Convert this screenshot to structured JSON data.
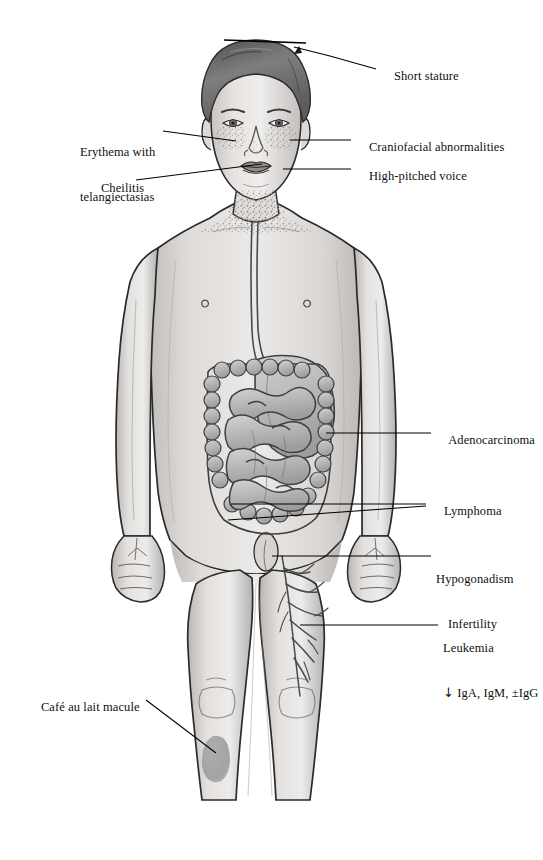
{
  "figure": {
    "background_color": "#ffffff",
    "width": 543,
    "height": 860
  },
  "palette": {
    "ink": "#101010",
    "leader_line": "#000000",
    "skin_light": "#e8e6e4",
    "skin_mid": "#cfcccb",
    "skin_shadow": "#b3b0ae",
    "outline": "#2a2a2a",
    "hair_dark": "#5a5a5a",
    "hair_mid": "#8a8a8a",
    "organ_fill": "#bcbcbc",
    "organ_shadow": "#9a9a9a",
    "organ_outline": "#4a4a4a",
    "macule": "#a3a3a3",
    "speckle": "#9b9b9b"
  },
  "labels": [
    {
      "id": "short-stature",
      "name": "label-short-stature",
      "text": "Short stature",
      "side": "right",
      "x": 381,
      "y": 62,
      "leader": [
        [
          376,
          69
        ],
        [
          330,
          56
        ],
        [
          294,
          47
        ]
      ]
    },
    {
      "id": "craniofacial-abnormalities",
      "name": "label-craniofacial-abnormalities",
      "text": "Craniofacial abnormalities",
      "side": "right",
      "x": 356,
      "y": 133,
      "leader": [
        [
          351,
          140
        ],
        [
          290,
          140
        ]
      ]
    },
    {
      "id": "high-pitched-voice",
      "name": "label-high-pitched-voice",
      "text": "High-pitched voice",
      "side": "right",
      "x": 356,
      "y": 162,
      "leader": [
        [
          351,
          169
        ],
        [
          283,
          169
        ]
      ]
    },
    {
      "id": "erythema-with-telangiectasias",
      "name": "label-erythema-with-telangiectasias",
      "text": "Erythema with",
      "text2": "telangiectasias",
      "side": "left",
      "x": 80,
      "y": 122,
      "leader": [
        [
          163,
          131
        ],
        [
          236,
          141
        ]
      ]
    },
    {
      "id": "cheilitis",
      "name": "label-cheilitis",
      "text": "Cheilitis",
      "side": "left",
      "x": 88,
      "y": 174,
      "leader": [
        [
          136,
          180
        ],
        [
          262,
          164
        ]
      ]
    },
    {
      "id": "adenocarcinoma",
      "name": "label-adenocarcinoma",
      "text": "Adenocarcinoma",
      "side": "right",
      "x": 436,
      "y": 426,
      "leader": [
        [
          431,
          433
        ],
        [
          326,
          433
        ]
      ]
    },
    {
      "id": "lymphoma",
      "name": "label-lymphoma",
      "text": "Lymphoma",
      "side": "right",
      "x": 431,
      "y": 497,
      "leader": [
        [
          426,
          504
        ],
        [
          231,
          504
        ]
      ],
      "leader2": [
        [
          426,
          506
        ],
        [
          228,
          520
        ]
      ]
    },
    {
      "id": "hypogonadism-infertility",
      "name": "label-hypogonadism-infertility",
      "text": "Hypogonadism",
      "text2": "Infertility",
      "side": "right",
      "x": 436,
      "y": 549,
      "leader": [
        [
          431,
          556
        ],
        [
          272,
          556
        ]
      ]
    },
    {
      "id": "leukemia",
      "name": "label-leukemia",
      "text": "Leukemia",
      "text2": "IgA, IgM, ±IgG",
      "sub_arrow": "↓",
      "side": "right",
      "x": 443,
      "y": 618,
      "leader": [
        [
          438,
          625
        ],
        [
          300,
          625
        ]
      ]
    },
    {
      "id": "cafe-au-lait-macule",
      "name": "label-cafe-au-lait-macule",
      "text": "Café au lait macule",
      "side": "left",
      "x": 28,
      "y": 693,
      "leader": [
        [
          146,
          700
        ],
        [
          216,
          753
        ]
      ]
    }
  ],
  "anatomy": {
    "parts": [
      {
        "name": "head",
        "label": "Head and face"
      },
      {
        "name": "hair",
        "label": "Hair"
      },
      {
        "name": "eyes",
        "label": "Eyes"
      },
      {
        "name": "nose",
        "label": "Nose"
      },
      {
        "name": "lips",
        "label": "Lips (cheilitis)"
      },
      {
        "name": "malar-rash",
        "label": "Malar butterfly erythema"
      },
      {
        "name": "neck-speckling",
        "label": "Neck and upper chest speckling"
      },
      {
        "name": "torso",
        "label": "Torso"
      },
      {
        "name": "arms",
        "label": "Arms"
      },
      {
        "name": "hands",
        "label": "Hands"
      },
      {
        "name": "esophagus",
        "label": "Esophagus"
      },
      {
        "name": "stomach",
        "label": "Stomach"
      },
      {
        "name": "colon",
        "label": "Large intestine / colon"
      },
      {
        "name": "small-intestine",
        "label": "Small intestine"
      },
      {
        "name": "genitalia",
        "label": "External genitalia"
      },
      {
        "name": "legs",
        "label": "Legs"
      },
      {
        "name": "vascular-tree",
        "label": "Vascular / lymphatic tree in right thigh"
      },
      {
        "name": "cafe-au-lait-patch",
        "label": "Café au lait macule on left shin"
      },
      {
        "name": "stature-bar",
        "label": "Stature reference bar above head"
      }
    ]
  }
}
